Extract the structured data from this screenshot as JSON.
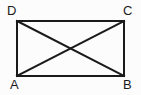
{
  "figure": {
    "background_color": "#fcfcfc",
    "stroke_color": "#1a1a1a",
    "stroke_width": 2,
    "label_color": "#1a1a1a",
    "vertices": [
      {
        "id": "A",
        "label": "A",
        "x": 17,
        "y": 76,
        "label_x": 10,
        "label_y": 78,
        "position": "bottom-left"
      },
      {
        "id": "B",
        "label": "B",
        "x": 124,
        "y": 76,
        "label_x": 123,
        "label_y": 78,
        "position": "bottom-right"
      },
      {
        "id": "C",
        "label": "C",
        "x": 124,
        "y": 21,
        "label_x": 123,
        "label_y": 4,
        "position": "top-right"
      },
      {
        "id": "D",
        "label": "D",
        "x": 17,
        "y": 21,
        "label_x": 7,
        "label_y": 4,
        "position": "top-left"
      }
    ],
    "edges": [
      {
        "id": "DC",
        "name": "top-edge",
        "x1": 17,
        "y1": 21,
        "x2": 124,
        "y2": 21
      },
      {
        "id": "CB",
        "name": "right-edge",
        "x1": 124,
        "y1": 21,
        "x2": 124,
        "y2": 76
      },
      {
        "id": "BA",
        "name": "bottom-edge",
        "x1": 124,
        "y1": 76,
        "x2": 17,
        "y2": 76
      },
      {
        "id": "AD",
        "name": "left-edge",
        "x1": 17,
        "y1": 76,
        "x2": 17,
        "y2": 21
      }
    ],
    "diagonals": [
      {
        "id": "AC",
        "name": "diagonal-a-c",
        "x1": 17,
        "y1": 76,
        "x2": 124,
        "y2": 21
      },
      {
        "id": "DB",
        "name": "diagonal-d-b",
        "x1": 17,
        "y1": 21,
        "x2": 124,
        "y2": 76
      }
    ],
    "intersection": {
      "x": 70.5,
      "y": 48.5
    }
  }
}
